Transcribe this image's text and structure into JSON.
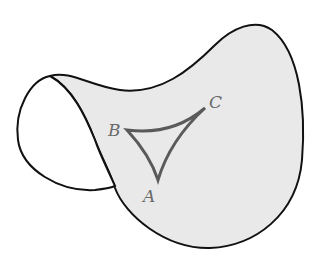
{
  "figure": {
    "colors": {
      "surface_fill": "#e9e9e9",
      "outline": "#111111",
      "triangle": "#5a5a5a",
      "labels": "#6a6a6a"
    }
  },
  "vertices": {
    "A": {
      "label": "A"
    },
    "B": {
      "label": "B"
    },
    "C": {
      "label": "C"
    }
  }
}
